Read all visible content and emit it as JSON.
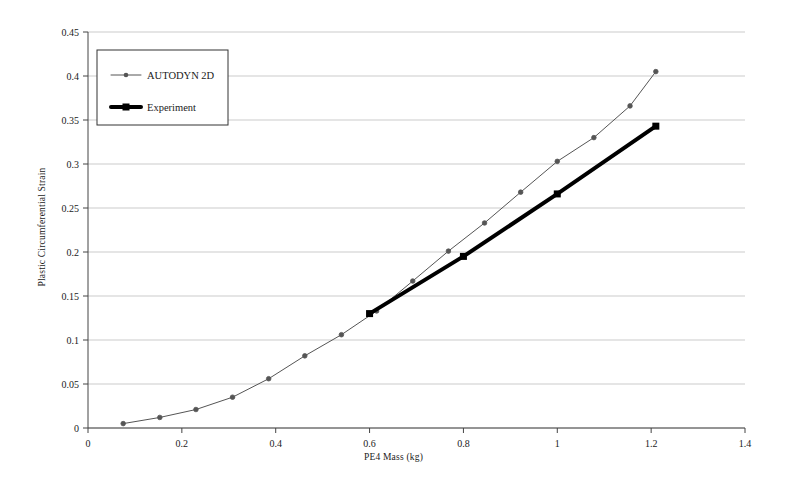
{
  "chart_data": {
    "type": "line",
    "title": "",
    "xlabel": "PE4 Mass (kg)",
    "ylabel": "Plastic Circumferential Strain",
    "xlim": [
      0,
      1.4
    ],
    "ylim": [
      0,
      0.45
    ],
    "xticks": [
      "0",
      "0.2",
      "0.4",
      "0.6",
      "0.8",
      "1",
      "1.2",
      "1.4"
    ],
    "xtick_values": [
      0,
      0.2,
      0.4,
      0.6,
      0.8,
      1.0,
      1.2,
      1.4
    ],
    "yticks": [
      "0",
      "0.05",
      "0.1",
      "0.15",
      "0.2",
      "0.25",
      "0.3",
      "0.35",
      "0.4",
      "0.45"
    ],
    "ytick_values": [
      0,
      0.05,
      0.1,
      0.15,
      0.2,
      0.25,
      0.3,
      0.35,
      0.4,
      0.45
    ],
    "grid": "horizontal",
    "legend_position": "upper-left-inside",
    "series": [
      {
        "name": "AUTODYN 2D",
        "color": "#555555",
        "line_width": 1,
        "marker": "circle",
        "marker_size": 4,
        "x": [
          0.075,
          0.153,
          0.23,
          0.308,
          0.385,
          0.462,
          0.54,
          0.615,
          0.692,
          0.768,
          0.845,
          0.922,
          1.0,
          1.078,
          1.155,
          1.21
        ],
        "y": [
          0.005,
          0.012,
          0.021,
          0.035,
          0.056,
          0.082,
          0.106,
          0.133,
          0.167,
          0.201,
          0.233,
          0.268,
          0.303,
          0.33,
          0.366,
          0.405
        ]
      },
      {
        "name": "Experiment",
        "color": "#000000",
        "line_width": 4,
        "marker": "square",
        "marker_size": 7,
        "x": [
          0.6,
          0.8,
          1.0,
          1.21
        ],
        "y": [
          0.13,
          0.195,
          0.266,
          0.343
        ]
      }
    ]
  },
  "legend": {
    "entries": [
      {
        "label": "AUTODYN 2D"
      },
      {
        "label": "Experiment"
      }
    ]
  }
}
